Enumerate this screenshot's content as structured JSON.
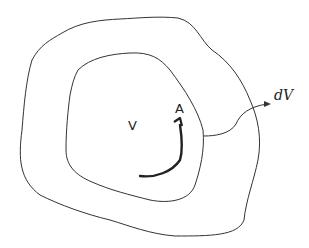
{
  "diagram": {
    "labels": {
      "inner_volume": "V",
      "surface": "A",
      "differential_volume": "dV"
    },
    "elements": [
      {
        "name": "outer-boundary",
        "shape": "irregular closed curve"
      },
      {
        "name": "inner-boundary",
        "shape": "irregular closed curve"
      },
      {
        "name": "surface-arrow",
        "shape": "curved arrow pointing to A"
      },
      {
        "name": "dv-leader-arrow",
        "shape": "curved arrow from inner boundary to dV"
      }
    ],
    "colors": {
      "line": "#333333",
      "background": "#ffffff"
    }
  }
}
